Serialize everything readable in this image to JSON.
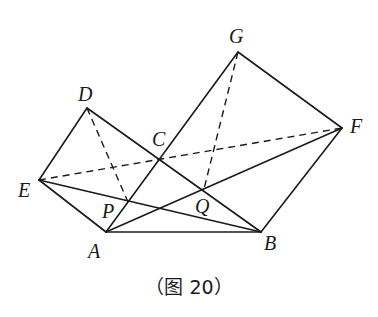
{
  "figure": {
    "caption": "（图 20）",
    "points": {
      "A": {
        "label": "A",
        "x": 106,
        "y": 232,
        "lx": 88,
        "ly": 258
      },
      "B": {
        "label": "B",
        "x": 261,
        "y": 232,
        "lx": 264,
        "ly": 250
      },
      "C": {
        "label": "C",
        "x": 160,
        "y": 158,
        "lx": 152,
        "ly": 146
      },
      "D": {
        "label": "D",
        "x": 87,
        "y": 108,
        "lx": 78,
        "ly": 101
      },
      "E": {
        "label": "E",
        "x": 39,
        "y": 180,
        "lx": 18,
        "ly": 197
      },
      "F": {
        "label": "F",
        "x": 342,
        "y": 128,
        "lx": 350,
        "ly": 133
      },
      "G": {
        "label": "G",
        "x": 238,
        "y": 52,
        "lx": 229,
        "ly": 43
      },
      "P": {
        "label": "P",
        "x": 128,
        "y": 202,
        "lx": 102,
        "ly": 218
      },
      "Q": {
        "label": "Q",
        "x": 204,
        "y": 189,
        "lx": 195,
        "ly": 213
      }
    },
    "solid_segments": [
      [
        "D",
        "E"
      ],
      [
        "D",
        "B"
      ],
      [
        "E",
        "A"
      ],
      [
        "A",
        "B"
      ],
      [
        "B",
        "F"
      ],
      [
        "F",
        "G"
      ],
      [
        "G",
        "A"
      ],
      [
        "E",
        "B"
      ],
      [
        "A",
        "F"
      ]
    ],
    "dashed_segments": [
      [
        "E",
        "F"
      ],
      [
        "D",
        "P"
      ],
      [
        "G",
        "Q"
      ]
    ]
  }
}
